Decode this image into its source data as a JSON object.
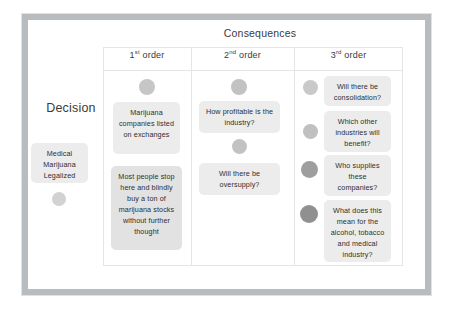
{
  "diagram": {
    "consequences_title": "Consequences",
    "decision_title": "Decision",
    "columns": [
      {
        "label": "1",
        "ordinal": "st",
        "suffix": " order"
      },
      {
        "label": "2",
        "ordinal": "nd",
        "suffix": " order"
      },
      {
        "label": "3",
        "ordinal": "rd",
        "suffix": " order"
      }
    ],
    "decision": {
      "note": "Medical Marijuana Legalized",
      "bullet_color": "#d2d2d2"
    },
    "first_order": [
      {
        "text": "Marijuana companies listed on exchanges",
        "bullet_color": "#c6c6c6"
      },
      {
        "text": "Most people stop here and blindly  buy a ton of marijuana stocks without further thought",
        "bullet_color": "#c6c6c6"
      }
    ],
    "second_order": [
      {
        "text": "How profitable is the industry?",
        "bullet_color": "#c2c2c2"
      },
      {
        "text": "Will  there be oversupply?",
        "bullet_color": "#c2c2c2"
      }
    ],
    "third_order": [
      {
        "text": "Will there be consolidation?",
        "bullet_color": "#c9c9c9"
      },
      {
        "text": "Which other industries will benefit?",
        "bullet_color": "#c0c0c0"
      },
      {
        "text": "Who supplies these companies?",
        "bullet_color": "#9e9e9e"
      },
      {
        "text": "What does this mean for the alcohol, tobacco and medical industry?",
        "bullet_color": "#909090"
      }
    ],
    "colors": {
      "frame": "#b9bcbe",
      "grid_line": "#e3e5e6",
      "note_bg": "#ececec",
      "note_bg_strong": "#e2e2e2",
      "text": "#2e2e2e",
      "background": "#ffffff"
    }
  }
}
